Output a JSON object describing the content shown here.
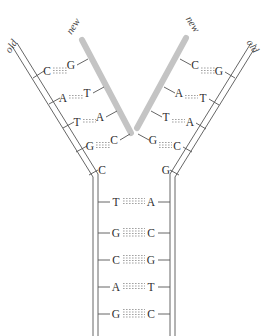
{
  "figure": {
    "background_color": "#ffffff",
    "strand_color": "#555555",
    "new_strand_color": "#c4c4c4",
    "base_text_color": "#2e2e2e",
    "bond_color": "#8a8a8a"
  },
  "labels": {
    "old_left": "old",
    "new_left": "new",
    "new_right": "new",
    "old_right": "old"
  },
  "left_arm": {
    "pairs": [
      {
        "template": "C",
        "new": "G",
        "bonds": 3
      },
      {
        "template": "A",
        "new": "T",
        "bonds": 2
      },
      {
        "template": "T",
        "new": "A",
        "bonds": 2
      },
      {
        "template": "G",
        "new": "C",
        "bonds": 3
      }
    ],
    "unpaired": [
      {
        "template": "C"
      }
    ]
  },
  "right_arm": {
    "pairs": [
      {
        "new": "C",
        "template": "G",
        "bonds": 3
      },
      {
        "new": "A",
        "template": "T",
        "bonds": 2
      },
      {
        "new": "T",
        "template": "A",
        "bonds": 2
      },
      {
        "new": "G",
        "template": "C",
        "bonds": 3
      }
    ],
    "unpaired": [
      {
        "template": "G"
      }
    ]
  },
  "parent_duplex": {
    "pairs": [
      {
        "left": "T",
        "right": "A",
        "bonds": 3
      },
      {
        "left": "G",
        "right": "C",
        "bonds": 4
      },
      {
        "left": "C",
        "right": "G",
        "bonds": 4
      },
      {
        "left": "A",
        "right": "T",
        "bonds": 3
      },
      {
        "left": "G",
        "right": "C",
        "bonds": 4
      }
    ]
  }
}
